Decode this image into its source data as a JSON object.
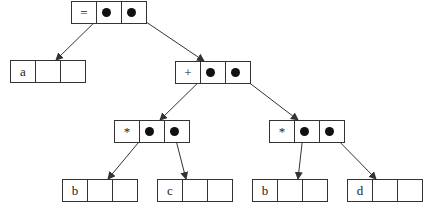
{
  "diagram": {
    "colors": {
      "line": "#333333",
      "dot": "#111111",
      "background": "#ffffff"
    },
    "nodes": [
      {
        "id": "eq",
        "label": "=",
        "x": 71,
        "y": 1,
        "left_ptr": true,
        "right_ptr": true
      },
      {
        "id": "a",
        "label": "a",
        "x": 10,
        "y": 60,
        "left_ptr": false,
        "right_ptr": false
      },
      {
        "id": "plus",
        "label": "+",
        "x": 175,
        "y": 61,
        "left_ptr": true,
        "right_ptr": true
      },
      {
        "id": "mul1",
        "label": "*",
        "x": 114,
        "y": 120,
        "left_ptr": true,
        "right_ptr": true
      },
      {
        "id": "mul2",
        "label": "*",
        "x": 269,
        "y": 120,
        "left_ptr": true,
        "right_ptr": true
      },
      {
        "id": "b1",
        "label": "b",
        "x": 62,
        "y": 179,
        "left_ptr": false,
        "right_ptr": false
      },
      {
        "id": "c",
        "label": "c",
        "x": 157,
        "y": 179,
        "left_ptr": false,
        "right_ptr": false
      },
      {
        "id": "b2",
        "label": "b",
        "x": 252,
        "y": 179,
        "left_ptr": false,
        "right_ptr": false
      },
      {
        "id": "d",
        "label": "d",
        "x": 347,
        "y": 179,
        "left_ptr": false,
        "right_ptr": false
      }
    ],
    "edges": [
      {
        "from": "eq",
        "slot": "left",
        "to": "a"
      },
      {
        "from": "eq",
        "slot": "right",
        "to": "plus"
      },
      {
        "from": "plus",
        "slot": "left",
        "to": "mul1"
      },
      {
        "from": "plus",
        "slot": "right",
        "to": "mul2"
      },
      {
        "from": "mul1",
        "slot": "left",
        "to": "b1"
      },
      {
        "from": "mul1",
        "slot": "right",
        "to": "c"
      },
      {
        "from": "mul2",
        "slot": "left",
        "to": "b2"
      },
      {
        "from": "mul2",
        "slot": "right",
        "to": "d"
      }
    ]
  }
}
